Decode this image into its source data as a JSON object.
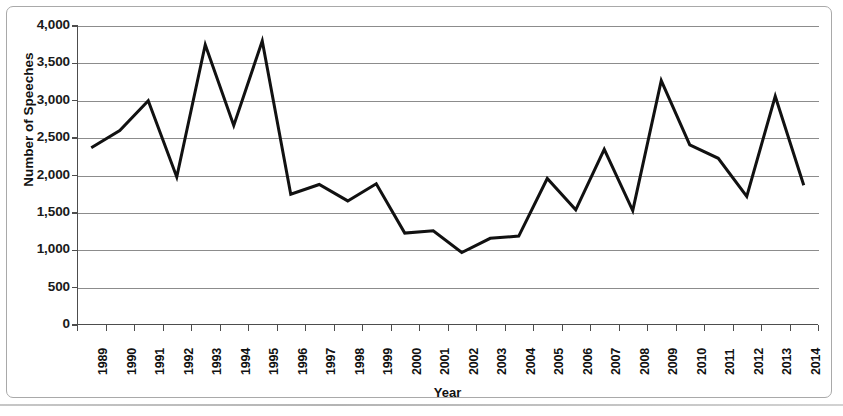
{
  "chart_data": {
    "type": "line",
    "title": "",
    "xlabel": "Year",
    "ylabel": "Number of Speeches",
    "categories": [
      "1989",
      "1990",
      "1991",
      "1992",
      "1993",
      "1994",
      "1995",
      "1996",
      "1997",
      "1998",
      "1999",
      "2000",
      "2001",
      "2002",
      "2003",
      "2004",
      "2005",
      "2006",
      "2007",
      "2008",
      "2009",
      "2010",
      "2011",
      "2012",
      "2013",
      "2014"
    ],
    "values": [
      2370,
      2600,
      3000,
      1980,
      3750,
      2670,
      3800,
      1750,
      1880,
      1660,
      1890,
      1230,
      1260,
      970,
      1160,
      1190,
      1960,
      1540,
      2350,
      1530,
      3270,
      2410,
      2230,
      1720,
      3060,
      1870
    ],
    "series": [
      {
        "name": "Number of Speeches",
        "values": [
          2370,
          2600,
          3000,
          1980,
          3750,
          2670,
          3800,
          1750,
          1880,
          1660,
          1890,
          1230,
          1260,
          970,
          1160,
          1190,
          1960,
          1540,
          2350,
          1530,
          3270,
          2410,
          2230,
          1720,
          3060,
          1870
        ]
      }
    ],
    "ylim": [
      0,
      4000
    ],
    "yticks": [
      0,
      500,
      1000,
      1500,
      2000,
      2500,
      3000,
      3500,
      4000
    ],
    "ytick_labels": [
      "0",
      "500",
      "1,000",
      "1,500",
      "2,000",
      "2,500",
      "3,000",
      "3,500",
      "4,000"
    ],
    "grid": true,
    "legend": false,
    "line_color": "#111111",
    "grid_color": "#8c8c8c",
    "axis_color": "#4d4d4d"
  },
  "axes": {
    "y_title": "Number of Speeches",
    "x_title": "Year"
  }
}
